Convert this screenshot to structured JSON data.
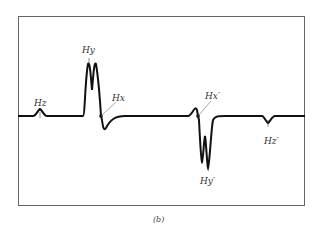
{
  "figure": {
    "caption": "(b)",
    "labels": {
      "hz": "Hz",
      "hy": "Hy",
      "hx": "Hx",
      "hx_prime": "Hx′",
      "hy_prime": "Hy′",
      "hz_prime": "Hz′"
    },
    "colors": {
      "trace": "#111111",
      "frame": "#555555"
    }
  }
}
